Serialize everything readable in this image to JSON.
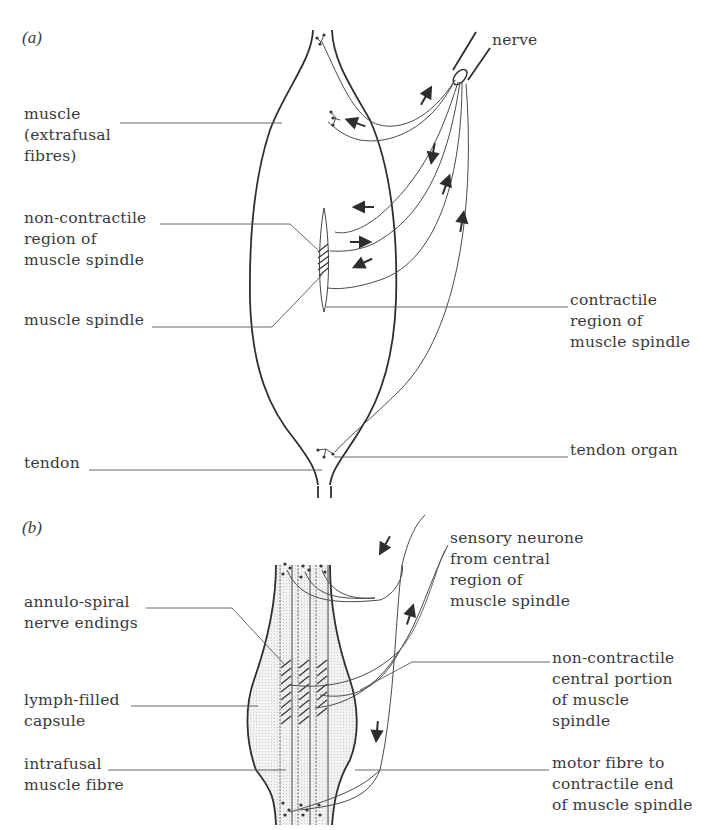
{
  "figure": {
    "panels": [
      {
        "id": "a",
        "label": "(a)",
        "labels": {
          "nerve": "nerve",
          "muscle": "muscle\n(extrafusal\nfibres)",
          "non_contractile": "non-contractile\nregion of\nmuscle spindle",
          "muscle_spindle": "muscle spindle",
          "contractile": "contractile\nregion of\nmuscle spindle",
          "tendon": "tendon",
          "tendon_organ": "tendon organ"
        }
      },
      {
        "id": "b",
        "label": "(b)",
        "labels": {
          "sensory_neurone": "sensory neurone\nfrom central\nregion of\nmuscle spindle",
          "annulo_spiral": "annulo-spiral\nnerve endings",
          "non_contractile_central": "non-contractile\ncentral portion\nof muscle\nspindle",
          "lymph_capsule": "lymph-filled\ncapsule",
          "intrafusal": "intrafusal\nmuscle fibre",
          "motor_fibre": "motor fibre to\ncontractile end\nof muscle spindle"
        }
      }
    ]
  },
  "colors": {
    "ink": "#2e2e2e",
    "text": "#3a3a3a",
    "capsule_fill": "#ececec",
    "background": "#ffffff"
  }
}
